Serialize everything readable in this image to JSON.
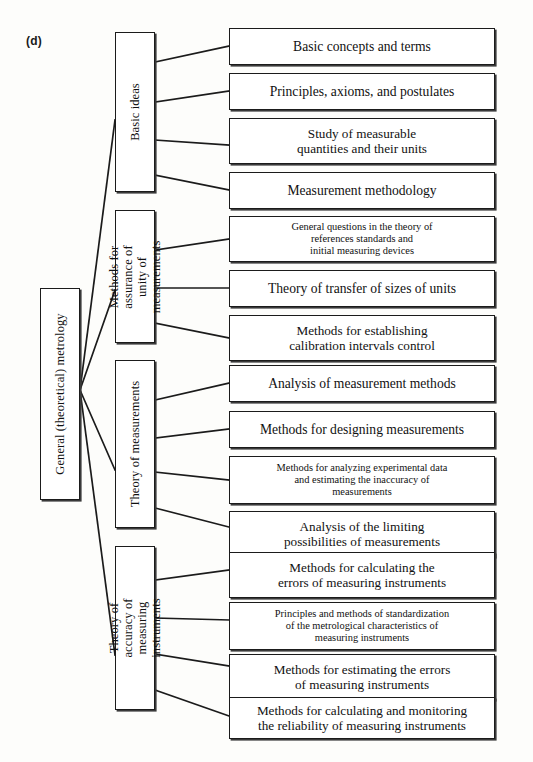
{
  "figure": {
    "label": "(d)",
    "root": {
      "text": "General (theoretical) metrology"
    },
    "groups": [
      {
        "text": "Basic ideas"
      },
      {
        "text": "Methods for assurance of\nunity of measurements"
      },
      {
        "text": "Theory of measurements"
      },
      {
        "text": "Theory of accuracy of\nmeasuring instruments"
      }
    ],
    "leaves": [
      {
        "text": "Basic concepts and terms",
        "size": "size-lg"
      },
      {
        "text": "Principles, axioms, and postulates",
        "size": "size-lg"
      },
      {
        "text": "Study of measurable\nquantities and their units",
        "size": "size-md"
      },
      {
        "text": "Measurement methodology",
        "size": "size-lg"
      },
      {
        "text": "General questions in the theory of\nreferences standards and\ninitial measuring devices",
        "size": "size-sm"
      },
      {
        "text": "Theory of transfer of sizes of units",
        "size": "size-lg"
      },
      {
        "text": "Methods for establishing\ncalibration intervals control",
        "size": "size-md"
      },
      {
        "text": "Analysis of measurement methods",
        "size": "size-lg"
      },
      {
        "text": "Methods for designing measurements",
        "size": "size-lg"
      },
      {
        "text": "Methods for analyzing experimental data\nand estimating the inaccuracy of\nmeasurements",
        "size": "size-sm"
      },
      {
        "text": "Analysis of the limiting\npossibilities of measurements",
        "size": "size-md"
      },
      {
        "text": "Methods for calculating the\nerrors of measuring instruments",
        "size": "size-md"
      },
      {
        "text": "Principles and methods of standardization\nof the metrological characteristics of\nmeasuring instruments",
        "size": "size-sm"
      },
      {
        "text": "Methods for estimating the errors\nof measuring instruments",
        "size": "size-md"
      },
      {
        "text": "Methods for calculating and monitoring\nthe reliability of measuring instruments",
        "size": "size-md"
      }
    ],
    "colors": {
      "stroke": "#1b1b1b",
      "shadow": "#3a3a3a",
      "background": "#fdfdfb",
      "text": "#111111"
    }
  }
}
